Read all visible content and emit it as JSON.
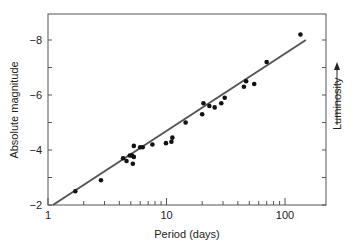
{
  "chart_data": {
    "type": "scatter",
    "title": "",
    "xlabel": "Period (days)",
    "ylabel": "Absolute magnitude",
    "right_label": "Luminosity",
    "xscale": "log",
    "xlim": [
      1,
      150
    ],
    "ylim": [
      -2,
      -9
    ],
    "x_ticks": [
      {
        "value": 1,
        "label": "1"
      },
      {
        "value": 10,
        "label": "10"
      },
      {
        "value": 100,
        "label": "100"
      }
    ],
    "y_ticks": [
      {
        "value": -8,
        "label": "-8"
      },
      {
        "value": -6,
        "label": "-6"
      },
      {
        "value": -4,
        "label": "-4"
      },
      {
        "value": -2,
        "label": "-2"
      }
    ],
    "grid": false,
    "legend": "none",
    "points": [
      {
        "x": 1.7,
        "y": -2.5
      },
      {
        "x": 2.8,
        "y": -2.9
      },
      {
        "x": 4.3,
        "y": -3.7
      },
      {
        "x": 4.6,
        "y": -3.6
      },
      {
        "x": 4.9,
        "y": -3.8
      },
      {
        "x": 5.1,
        "y": -3.8
      },
      {
        "x": 5.2,
        "y": -3.5
      },
      {
        "x": 5.3,
        "y": -3.75
      },
      {
        "x": 5.3,
        "y": -4.15
      },
      {
        "x": 6.0,
        "y": -4.1
      },
      {
        "x": 6.3,
        "y": -4.1
      },
      {
        "x": 7.6,
        "y": -4.2
      },
      {
        "x": 9.9,
        "y": -4.25
      },
      {
        "x": 11.0,
        "y": -4.3
      },
      {
        "x": 11.2,
        "y": -4.45
      },
      {
        "x": 14.5,
        "y": -5.0
      },
      {
        "x": 20.0,
        "y": -5.3
      },
      {
        "x": 20.5,
        "y": -5.7
      },
      {
        "x": 23.0,
        "y": -5.6
      },
      {
        "x": 25.5,
        "y": -5.55
      },
      {
        "x": 29.0,
        "y": -5.7
      },
      {
        "x": 31.0,
        "y": -5.9
      },
      {
        "x": 45.0,
        "y": -6.3
      },
      {
        "x": 47.0,
        "y": -6.5
      },
      {
        "x": 55.0,
        "y": -6.4
      },
      {
        "x": 70.0,
        "y": -7.2
      },
      {
        "x": 135.0,
        "y": -8.2
      }
    ],
    "fit_line": {
      "x": [
        1.1,
        150
      ],
      "y": [
        -2.0,
        -8.0
      ]
    }
  }
}
